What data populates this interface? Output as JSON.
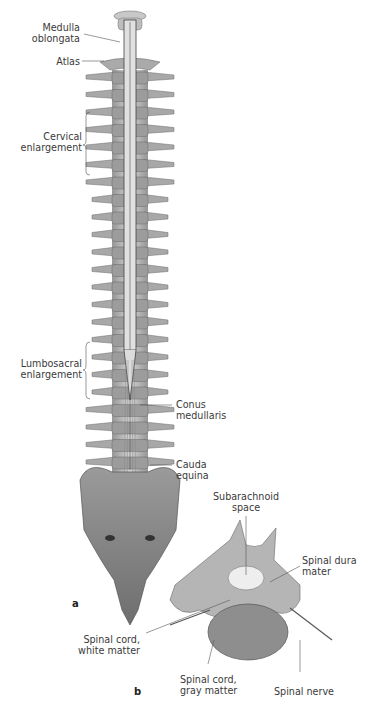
{
  "figure": {
    "panel_a": {
      "letter": "a",
      "labels": {
        "medulla": "Medulla\noblongata",
        "atlas": "Atlas",
        "cervical": "Cervical\nenlargement",
        "lumbosacral": "Lumbosacral\nenlargement",
        "conus": "Conus\nmedullaris",
        "cauda": "Cauda\nequina"
      }
    },
    "panel_b": {
      "letter": "b",
      "labels": {
        "subarachnoid": "Subarachnoid\nspace",
        "dura": "Spinal dura\nmater",
        "white": "Spinal cord,\nwhite matter",
        "gray": "Spinal cord,\ngray matter",
        "nerve": "Spinal nerve"
      }
    },
    "colors": {
      "bone": "#b9b9b9",
      "bone_dark": "#7d7d7d",
      "cord": "#d8d8d8",
      "text": "#3a3a3a",
      "leader": "#555555"
    }
  }
}
